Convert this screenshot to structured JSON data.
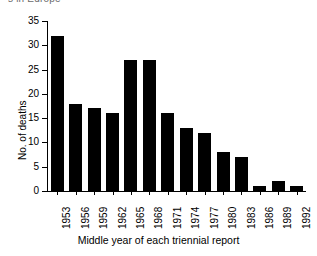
{
  "figure": {
    "caption_sliver": "s in Europe",
    "background_color": "#ffffff",
    "bar_color": "#000000",
    "axis_color": "#000000"
  },
  "chart_data": {
    "type": "bar",
    "title": "",
    "xlabel": "Middle year of each triennial report",
    "ylabel": "No. of deaths",
    "categories": [
      "1953",
      "1956",
      "1959",
      "1962",
      "1965",
      "1968",
      "1971",
      "1974",
      "1977",
      "1980",
      "1983",
      "1986",
      "1989",
      "1992"
    ],
    "values": [
      32,
      18,
      17,
      16,
      27,
      27,
      16,
      13,
      12,
      8,
      7,
      1,
      2,
      1
    ],
    "ylim": [
      0,
      35
    ],
    "yticks": [
      0,
      5,
      10,
      15,
      20,
      25,
      30,
      35
    ],
    "ytick_labels": [
      "0",
      "5",
      "10",
      "15",
      "20",
      "25",
      "30",
      "35"
    ],
    "grid": false,
    "legend": null
  }
}
